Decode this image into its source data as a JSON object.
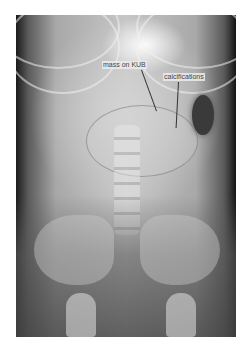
{
  "image": {
    "description": "Abdominal radiograph (KUB) of a child with annotation labels",
    "annotations": [
      {
        "id": "mass",
        "label": "mass on KUB"
      },
      {
        "id": "calc",
        "label": "calcifications"
      }
    ]
  }
}
